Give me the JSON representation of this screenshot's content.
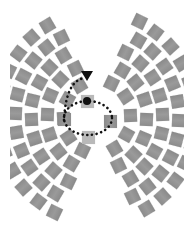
{
  "diagram": {
    "colors": {
      "square": "#939393",
      "center_square": "#b9b9b9",
      "dots": "#111111",
      "background": "#ffffff"
    },
    "origin": {
      "x": 97,
      "y": 117
    },
    "rings": [
      {
        "radius": 34,
        "count_left": 5,
        "count_right": 5
      },
      {
        "radius": 50,
        "count_left": 7,
        "count_right": 7
      },
      {
        "radius": 66,
        "count_left": 9,
        "count_right": 9
      },
      {
        "radius": 82,
        "count_left": 11,
        "count_right": 11
      },
      {
        "radius": 98,
        "count_left": 12,
        "count_right": 12
      }
    ],
    "fan_half_angle_deg": 62,
    "center_elements": {
      "dot": {
        "x": 87,
        "y": 101,
        "r": 4
      },
      "squares": [
        {
          "name": "top",
          "x": 81,
          "y": 95
        },
        {
          "name": "left",
          "x": 58,
          "y": 113
        },
        {
          "name": "right",
          "x": 104,
          "y": 115
        },
        {
          "name": "bottom",
          "x": 82,
          "y": 131
        }
      ],
      "ellipse": {
        "cx": 88,
        "cy": 118,
        "rx": 24,
        "ry": 17
      },
      "arrow": {
        "start": {
          "x": 64,
          "y": 120
        },
        "control": {
          "x": 66,
          "y": 80
        },
        "end": {
          "x": 88,
          "y": 74
        }
      }
    }
  }
}
